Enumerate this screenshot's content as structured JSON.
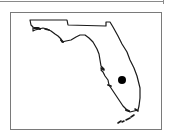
{
  "map": {
    "region": "Florida",
    "outline_color": "#1a1a1a",
    "frame_color": "#7a7a7a",
    "background": "#ffffff",
    "marker": {
      "label": "Location marker",
      "color": "#000000",
      "cx": 122,
      "cy": 80,
      "r": 4
    }
  }
}
